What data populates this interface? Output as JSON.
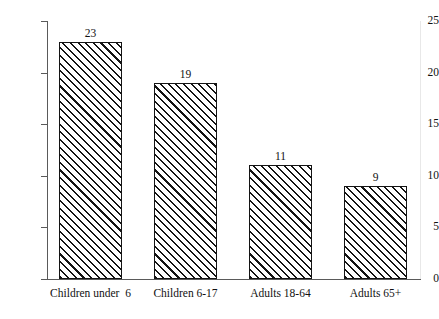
{
  "chart_data": {
    "type": "bar",
    "title": "",
    "subtitle": "",
    "xlabel": "",
    "ylabel": "",
    "categories": [
      "Children under  6",
      "Children 6-17",
      "Adults 18-64",
      "Adults 65+"
    ],
    "values": [
      23,
      19,
      11,
      9
    ],
    "value_labels": [
      "23",
      "19",
      "11",
      "9"
    ],
    "ylim": [
      0,
      25
    ],
    "ytick_labels": [
      "0",
      "5",
      "10",
      "15",
      "20",
      "25"
    ],
    "ytick_values": [
      0,
      5,
      10,
      15,
      20,
      25
    ],
    "grid": false,
    "legend": null,
    "bar_fill": "diagonal-hatch",
    "colors": {
      "bar_line": "#141414",
      "bar_background": "#ffffff",
      "axis": "#5a5a5a",
      "text": "#111111",
      "page_background": "#ffffff"
    }
  }
}
